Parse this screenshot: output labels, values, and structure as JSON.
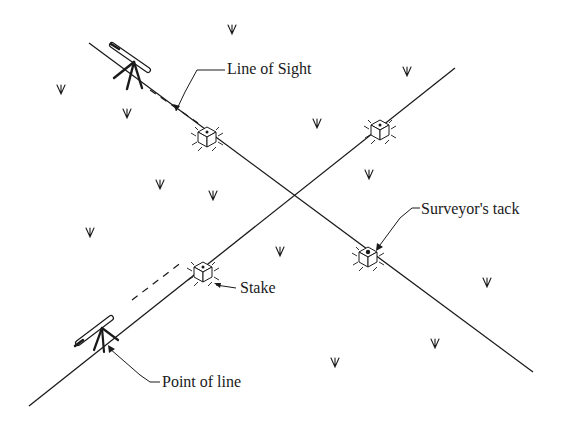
{
  "diagram": {
    "colors": {
      "ink": "#1a1a1a",
      "background": "#ffffff"
    },
    "labels": {
      "line_of_sight": "Line of Sight",
      "surveyors_tack": "Surveyor's tack",
      "stake": "Stake",
      "point_of_line": "Point of line"
    },
    "lines": [
      {
        "name": "line-a",
        "x1": 89,
        "y1": 43,
        "x2": 533,
        "y2": 372
      },
      {
        "name": "line-b",
        "x1": 455,
        "y1": 68,
        "x2": 29,
        "y2": 406
      }
    ],
    "intersection": {
      "x": 294,
      "y": 196
    },
    "stakes": [
      {
        "name": "stake-upper-left",
        "x": 207,
        "y": 137,
        "tack": false
      },
      {
        "name": "stake-upper-right",
        "x": 380,
        "y": 130,
        "tack": false
      },
      {
        "name": "stake-lower-left",
        "x": 203,
        "y": 272,
        "tack": false
      },
      {
        "name": "stake-lower-right",
        "x": 368,
        "y": 257,
        "tack": true
      }
    ],
    "instruments": [
      {
        "name": "transit-top",
        "x": 130,
        "y": 75
      },
      {
        "name": "transit-bottom",
        "x": 95,
        "y": 318
      }
    ],
    "grass": [
      {
        "x": 232,
        "y": 30
      },
      {
        "x": 61,
        "y": 90
      },
      {
        "x": 127,
        "y": 114
      },
      {
        "x": 407,
        "y": 72
      },
      {
        "x": 317,
        "y": 124
      },
      {
        "x": 160,
        "y": 185
      },
      {
        "x": 213,
        "y": 196
      },
      {
        "x": 369,
        "y": 175
      },
      {
        "x": 90,
        "y": 233
      },
      {
        "x": 280,
        "y": 252
      },
      {
        "x": 487,
        "y": 283
      },
      {
        "x": 435,
        "y": 344
      },
      {
        "x": 335,
        "y": 363
      }
    ]
  }
}
